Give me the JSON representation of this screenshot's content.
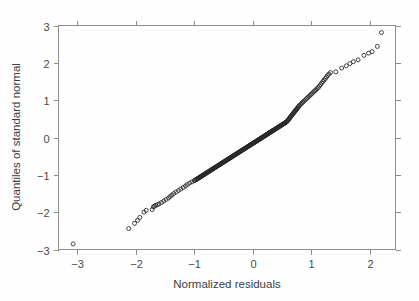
{
  "figure": {
    "width": 419,
    "height": 301,
    "background_color": "#fefefe",
    "frame_color": "#8d8d8d",
    "marker_color": "#262626",
    "text_color": "#3d3d3d"
  },
  "chart_data": {
    "type": "scatter",
    "title": "",
    "subtitle": "",
    "xlabel": "Normalized residuals",
    "ylabel": "Quantiles of standard normal",
    "xlim": [
      -3.32,
      2.44
    ],
    "ylim": [
      -3.0,
      3.0
    ],
    "xticks": [
      -3,
      -2,
      -1,
      0,
      1,
      2
    ],
    "yticks": [
      -3,
      -2,
      -1,
      0,
      1,
      2,
      3
    ],
    "xticklabels": [
      "-3",
      "-2",
      "-1",
      "0",
      "1",
      "2"
    ],
    "yticklabels": [
      "-3",
      "-2",
      "-1",
      "0",
      "1",
      "2",
      "3"
    ],
    "grid": false,
    "legend": null,
    "legend_position": "none",
    "marker": "open-circle",
    "marker_size": 2.0,
    "annotations": [],
    "x": [
      -3.07,
      -2.12,
      -2.02,
      -1.97,
      -1.93,
      -1.86,
      -1.82,
      -1.72,
      -1.7,
      -1.68,
      -1.66,
      -1.63,
      -1.6,
      -1.56,
      -1.52,
      -1.48,
      -1.44,
      -1.41,
      -1.38,
      -1.35,
      -1.31,
      -1.27,
      -1.23,
      -1.19,
      -1.15,
      -1.12,
      -1.08,
      -1.04,
      -1.0,
      -0.99,
      -0.97,
      -0.96,
      -0.95,
      -0.94,
      -0.93,
      -0.92,
      -0.91,
      -0.9,
      -0.89,
      -0.88,
      -0.87,
      -0.86,
      -0.85,
      -0.84,
      -0.83,
      -0.82,
      -0.81,
      -0.8,
      -0.79,
      -0.78,
      -0.77,
      -0.76,
      -0.75,
      -0.74,
      -0.73,
      -0.72,
      -0.71,
      -0.7,
      -0.69,
      -0.68,
      -0.67,
      -0.66,
      -0.65,
      -0.64,
      -0.63,
      -0.62,
      -0.61,
      -0.6,
      -0.59,
      -0.58,
      -0.57,
      -0.56,
      -0.55,
      -0.54,
      -0.53,
      -0.52,
      -0.51,
      -0.5,
      -0.49,
      -0.48,
      -0.47,
      -0.46,
      -0.45,
      -0.44,
      -0.43,
      -0.42,
      -0.41,
      -0.4,
      -0.39,
      -0.38,
      -0.37,
      -0.36,
      -0.35,
      -0.34,
      -0.33,
      -0.32,
      -0.31,
      -0.3,
      -0.29,
      -0.28,
      -0.27,
      -0.26,
      -0.25,
      -0.24,
      -0.23,
      -0.22,
      -0.21,
      -0.2,
      -0.19,
      -0.18,
      -0.17,
      -0.16,
      -0.15,
      -0.14,
      -0.13,
      -0.12,
      -0.11,
      -0.1,
      -0.09,
      -0.08,
      -0.07,
      -0.06,
      -0.05,
      -0.04,
      -0.03,
      -0.02,
      -0.01,
      0.0,
      0.01,
      0.02,
      0.03,
      0.04,
      0.05,
      0.06,
      0.07,
      0.08,
      0.09,
      0.1,
      0.11,
      0.12,
      0.13,
      0.14,
      0.15,
      0.16,
      0.17,
      0.18,
      0.19,
      0.2,
      0.21,
      0.22,
      0.23,
      0.24,
      0.25,
      0.26,
      0.27,
      0.28,
      0.29,
      0.3,
      0.31,
      0.32,
      0.33,
      0.34,
      0.35,
      0.36,
      0.37,
      0.38,
      0.39,
      0.4,
      0.41,
      0.42,
      0.43,
      0.44,
      0.45,
      0.46,
      0.47,
      0.48,
      0.49,
      0.5,
      0.51,
      0.52,
      0.53,
      0.54,
      0.55,
      0.56,
      0.57,
      0.58,
      0.59,
      0.6,
      0.61,
      0.62,
      0.63,
      0.64,
      0.65,
      0.66,
      0.67,
      0.68,
      0.69,
      0.7,
      0.71,
      0.72,
      0.73,
      0.74,
      0.75,
      0.76,
      0.77,
      0.78,
      0.79,
      0.8,
      0.82,
      0.84,
      0.86,
      0.88,
      0.9,
      0.92,
      0.94,
      0.96,
      0.98,
      1.0,
      1.02,
      1.04,
      1.06,
      1.08,
      1.1,
      1.12,
      1.14,
      1.16,
      1.18,
      1.2,
      1.22,
      1.24,
      1.26,
      1.28,
      1.3,
      1.33,
      1.42,
      1.52,
      1.6,
      1.66,
      1.72,
      1.8,
      1.9,
      1.98,
      2.04,
      2.13,
      2.2
    ],
    "y": [
      -2.85,
      -2.44,
      -2.3,
      -2.22,
      -2.14,
      -2.0,
      -1.95,
      -1.93,
      -1.86,
      -1.84,
      -1.82,
      -1.8,
      -1.78,
      -1.74,
      -1.7,
      -1.66,
      -1.62,
      -1.58,
      -1.54,
      -1.5,
      -1.46,
      -1.42,
      -1.38,
      -1.34,
      -1.3,
      -1.26,
      -1.22,
      -1.19,
      -1.16,
      -1.14,
      -1.13,
      -1.12,
      -1.11,
      -1.1,
      -1.09,
      -1.08,
      -1.07,
      -1.06,
      -1.05,
      -1.04,
      -1.03,
      -1.02,
      -1.01,
      -1.0,
      -0.99,
      -0.98,
      -0.97,
      -0.96,
      -0.95,
      -0.94,
      -0.93,
      -0.92,
      -0.91,
      -0.9,
      -0.89,
      -0.88,
      -0.87,
      -0.86,
      -0.85,
      -0.84,
      -0.83,
      -0.82,
      -0.81,
      -0.8,
      -0.79,
      -0.78,
      -0.77,
      -0.76,
      -0.75,
      -0.74,
      -0.73,
      -0.72,
      -0.71,
      -0.7,
      -0.69,
      -0.68,
      -0.67,
      -0.66,
      -0.65,
      -0.64,
      -0.63,
      -0.62,
      -0.61,
      -0.6,
      -0.59,
      -0.58,
      -0.57,
      -0.56,
      -0.55,
      -0.54,
      -0.53,
      -0.52,
      -0.51,
      -0.5,
      -0.49,
      -0.48,
      -0.47,
      -0.46,
      -0.45,
      -0.44,
      -0.43,
      -0.42,
      -0.41,
      -0.4,
      -0.39,
      -0.38,
      -0.37,
      -0.36,
      -0.35,
      -0.34,
      -0.33,
      -0.32,
      -0.31,
      -0.3,
      -0.29,
      -0.28,
      -0.27,
      -0.26,
      -0.25,
      -0.24,
      -0.23,
      -0.22,
      -0.21,
      -0.2,
      -0.19,
      -0.18,
      -0.17,
      -0.16,
      -0.15,
      -0.14,
      -0.13,
      -0.12,
      -0.11,
      -0.1,
      -0.09,
      -0.08,
      -0.07,
      -0.06,
      -0.05,
      -0.04,
      -0.03,
      -0.02,
      -0.01,
      0.0,
      0.01,
      0.02,
      0.03,
      0.04,
      0.05,
      0.06,
      0.07,
      0.08,
      0.09,
      0.1,
      0.11,
      0.12,
      0.13,
      0.14,
      0.15,
      0.16,
      0.17,
      0.18,
      0.19,
      0.2,
      0.21,
      0.22,
      0.23,
      0.24,
      0.25,
      0.26,
      0.27,
      0.28,
      0.29,
      0.3,
      0.31,
      0.32,
      0.33,
      0.34,
      0.35,
      0.36,
      0.37,
      0.38,
      0.39,
      0.4,
      0.41,
      0.42,
      0.44,
      0.46,
      0.48,
      0.5,
      0.52,
      0.54,
      0.56,
      0.58,
      0.6,
      0.62,
      0.64,
      0.66,
      0.68,
      0.7,
      0.72,
      0.74,
      0.76,
      0.78,
      0.8,
      0.82,
      0.84,
      0.86,
      0.89,
      0.92,
      0.95,
      0.98,
      1.01,
      1.04,
      1.07,
      1.1,
      1.13,
      1.16,
      1.19,
      1.22,
      1.25,
      1.28,
      1.31,
      1.34,
      1.38,
      1.42,
      1.46,
      1.5,
      1.54,
      1.58,
      1.62,
      1.66,
      1.7,
      1.74,
      1.76,
      1.86,
      1.92,
      1.98,
      2.03,
      2.08,
      2.2,
      2.26,
      2.3,
      2.44,
      2.81
    ]
  }
}
